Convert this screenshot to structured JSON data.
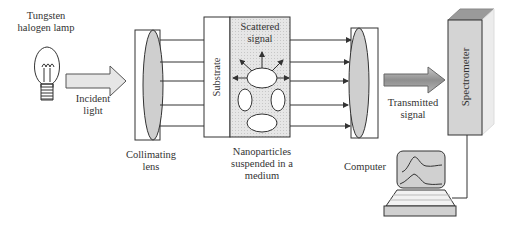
{
  "labels": {
    "lamp": [
      "Tungsten",
      "halogen lamp"
    ],
    "incident": [
      "Incident",
      "light"
    ],
    "collimating": [
      "Collimating",
      "lens"
    ],
    "substrate": "Substrate",
    "scattered": [
      "Scattered",
      "signal"
    ],
    "nanoparticles": [
      "Nanoparticles",
      "suspended in a",
      "medium"
    ],
    "transmitted": [
      "Transmitted",
      "signal"
    ],
    "spectrometer": "Spectrometer",
    "computer": "Computer"
  },
  "colors": {
    "stroke": "#333333",
    "lens_fill": "#cfcfcf",
    "medium_fill": "#e3e3e3",
    "spectrometer_fill": "#d4d4d4",
    "spectrometer_top": "#9a9a9a",
    "spectrometer_side": "#ebebeb",
    "arrow_fill": "#dcdcdc",
    "transmitted_arrow_fill": "#a9a9a9"
  }
}
